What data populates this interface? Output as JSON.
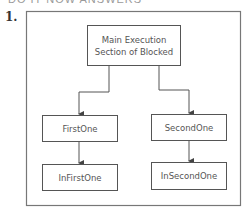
{
  "header": {
    "partial_text": "DO IT NOW ANSWERS"
  },
  "item": {
    "number": "1."
  },
  "diagram": {
    "nodes": {
      "main": {
        "line1": "Main Execution",
        "line2": "Section of Blocked"
      },
      "first": {
        "label": "FirstOne"
      },
      "second": {
        "label": "SecondOne"
      },
      "in_first": {
        "label": "InFirstOne"
      },
      "in_second": {
        "label": "InSecondOne"
      }
    },
    "edges": [
      {
        "from": "Main Execution Section of Blocked",
        "to": "FirstOne"
      },
      {
        "from": "Main Execution Section of Blocked",
        "to": "SecondOne"
      },
      {
        "from": "FirstOne",
        "to": "InFirstOne"
      },
      {
        "from": "SecondOne",
        "to": "InSecondOne"
      }
    ],
    "colors": {
      "stroke": "#555555",
      "outer_stroke": "#777777",
      "text": "#555555"
    }
  }
}
